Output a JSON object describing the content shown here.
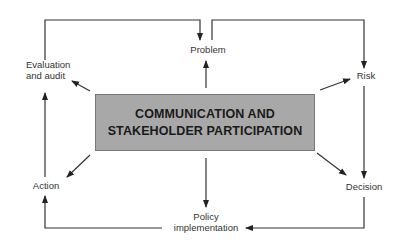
{
  "diagram": {
    "center": {
      "line1": "COMMUNICATION AND",
      "line2": "STAKEHOLDER PARTICIPATION",
      "fill": "#a8a8a8"
    },
    "nodes": {
      "problem": "Problem",
      "risk": "Risk",
      "decision": "Decision",
      "policy_line1": "Policy",
      "policy_line2": "implementation",
      "action": "Action",
      "evaluation_line1": "Evaluation",
      "evaluation_line2": "and audit"
    },
    "edges": [
      {
        "from": "Evaluation and audit",
        "to": "Problem"
      },
      {
        "from": "Problem",
        "to": "Risk"
      },
      {
        "from": "Risk",
        "to": "Decision"
      },
      {
        "from": "Decision",
        "to": "Policy implementation"
      },
      {
        "from": "Policy implementation",
        "to": "Action"
      },
      {
        "from": "Action",
        "to": "Evaluation and audit"
      },
      {
        "from": "Communication and stakeholder participation",
        "to": "Problem"
      },
      {
        "from": "Communication and stakeholder participation",
        "to": "Risk"
      },
      {
        "from": "Communication and stakeholder participation",
        "to": "Decision"
      },
      {
        "from": "Communication and stakeholder participation",
        "to": "Policy implementation"
      },
      {
        "from": "Communication and stakeholder participation",
        "to": "Action"
      },
      {
        "from": "Communication and stakeholder participation",
        "to": "Evaluation and audit"
      }
    ]
  }
}
